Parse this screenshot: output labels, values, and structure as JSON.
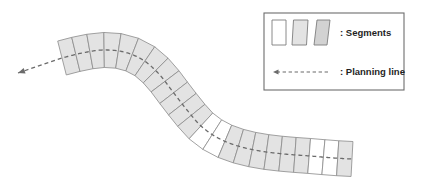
{
  "figure": {
    "width": 421,
    "height": 193,
    "background_color": "#ffffff"
  },
  "colors": {
    "segment_fill_gray": "#e3e3e3",
    "segment_fill_white": "#ffffff",
    "segment_stroke": "#8a8a8a",
    "planning_line": "#6b6b6b",
    "legend_border": "#6d6d6d",
    "legend_text": "#1f1f1f",
    "legend_swatch_dark": "#d2d2d2"
  },
  "legend": {
    "box": {
      "x": 264,
      "y": 13,
      "width": 140,
      "height": 77
    },
    "entries": [
      {
        "id": "segments",
        "label": ": Segments",
        "label_x": 340,
        "label_y": 33,
        "swatches": [
          {
            "name": "segment-swatch-white",
            "fill": "#ffffff",
            "x": 272,
            "y": 20,
            "width": 14,
            "height": 25,
            "skew": 0
          },
          {
            "name": "segment-swatch-light-gray",
            "fill": "#e3e3e3",
            "x": 292,
            "y": 20,
            "width": 16,
            "height": 25,
            "skew": 1.5
          },
          {
            "name": "segment-swatch-dark-gray",
            "fill": "#d2d2d2",
            "x": 314,
            "y": 20,
            "width": 16,
            "height": 25,
            "skew": 3
          }
        ]
      },
      {
        "id": "planning-line",
        "label": ": Planning line",
        "label_x": 340,
        "label_y": 72,
        "line": {
          "x1": 328,
          "x2": 276,
          "y": 72
        }
      }
    ]
  },
  "path_diagram": {
    "segment_count": 23,
    "band_half_width": 17.5,
    "white_segment_indices": [
      13,
      14,
      21,
      22
    ],
    "centerline": {
      "description": "S-shaped planning line running left to right through all segments",
      "points": [
        [
          62,
          58
        ],
        [
          82,
          53
        ],
        [
          103,
          50
        ],
        [
          124,
          52
        ],
        [
          143,
          60
        ],
        [
          159,
          74
        ],
        [
          173,
          92
        ],
        [
          187,
          110
        ],
        [
          201,
          126
        ],
        [
          218,
          138
        ],
        [
          238,
          146
        ],
        [
          260,
          151
        ],
        [
          284,
          154
        ],
        [
          310,
          156
        ],
        [
          334,
          158
        ],
        [
          352,
          159
        ]
      ]
    },
    "arrow": {
      "name": "planning-line-arrow",
      "tip": [
        18,
        73
      ],
      "tail": [
        62,
        58
      ],
      "direction": "left"
    }
  }
}
